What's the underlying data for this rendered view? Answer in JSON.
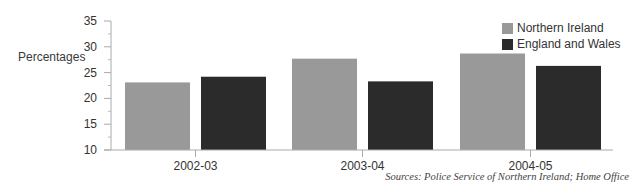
{
  "chart_data": {
    "type": "bar",
    "title": "",
    "xlabel": "",
    "ylabel": "Percentages",
    "ylim": [
      10,
      35
    ],
    "yticks": [
      10,
      15,
      20,
      25,
      30,
      35
    ],
    "categories": [
      "2002-03",
      "2003-04",
      "2004-05"
    ],
    "series": [
      {
        "name": "Northern Ireland",
        "color": "#999999",
        "values": [
          23.1,
          27.7,
          28.7
        ]
      },
      {
        "name": "England and Wales",
        "color": "#2b2b2b",
        "values": [
          24.2,
          23.3,
          26.3
        ]
      }
    ],
    "legend_position": "top-right",
    "grid": false,
    "source": "Sources: Police Service of Northern Ireland; Home Office"
  }
}
